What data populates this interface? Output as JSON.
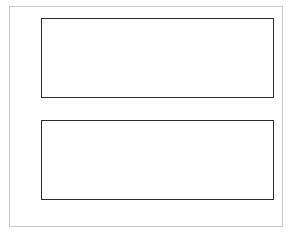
{
  "figure": {
    "background_color": "#ffffff",
    "frame_color": "#c9c9c9",
    "axis_color": "#2b2b2b",
    "line_color": "#2b2b2b",
    "xlabel_var": "x",
    "xlabel_rest": "-axis"
  },
  "chart_data": [
    {
      "type": "line",
      "panel": "top",
      "title": "",
      "xlabel": "",
      "ylabel": "",
      "xlim": [
        0,
        10
      ],
      "ylim": [
        -1.1,
        1.1
      ],
      "grid": false,
      "legend": null,
      "xticks": [
        0,
        2,
        4,
        6,
        8,
        10
      ],
      "xtick_labels": [
        "0",
        "2",
        "4",
        "6",
        "8",
        "10"
      ],
      "yticks": [
        -1.0,
        -0.5,
        0.0,
        0.5,
        1.0
      ],
      "ytick_labels": [
        "−1.0",
        "−0.5",
        "0.0",
        "0.5",
        "1.0"
      ],
      "series": [
        {
          "name": "sin(2.5x)",
          "color": "#2b2b2b",
          "linewidth": 1.0,
          "x": [
            0.0,
            0.1,
            0.2,
            0.3,
            0.4,
            0.5,
            0.6,
            0.7,
            0.8,
            0.9,
            1.0,
            1.1,
            1.2,
            1.3,
            1.4,
            1.5,
            1.6,
            1.7,
            1.8,
            1.9,
            2.0,
            2.1,
            2.2,
            2.3,
            2.4,
            2.5,
            2.6,
            2.7,
            2.8,
            2.9,
            3.0,
            3.1,
            3.2,
            3.3,
            3.4,
            3.5,
            3.6,
            3.7,
            3.8,
            3.9,
            4.0,
            4.1,
            4.2,
            4.3,
            4.4,
            4.5,
            4.6,
            4.7,
            4.8,
            4.9,
            5.0,
            5.1,
            5.2,
            5.3,
            5.4,
            5.5,
            5.6,
            5.7,
            5.8,
            5.9,
            6.0,
            6.1,
            6.2,
            6.3,
            6.4,
            6.5,
            6.6,
            6.7,
            6.8,
            6.9,
            7.0,
            7.1,
            7.2,
            7.3,
            7.4,
            7.5,
            7.6,
            7.7,
            7.8,
            7.9,
            8.0,
            8.1,
            8.2,
            8.3,
            8.4,
            8.5,
            8.6,
            8.7,
            8.8,
            8.9,
            9.0,
            9.1,
            9.2,
            9.3,
            9.4,
            9.5,
            9.6,
            9.7,
            9.8,
            9.9,
            10.0
          ],
          "y": [
            0.0,
            0.2474,
            0.4794,
            0.6816,
            0.8415,
            0.949,
            0.9975,
            0.984,
            0.9093,
            0.7781,
            0.5985,
            0.3818,
            0.1411,
            -0.1082,
            -0.3508,
            -0.5716,
            -0.7568,
            -0.8949,
            -0.9775,
            -0.9999,
            -0.9589,
            -0.8589,
            -0.7055,
            -0.5083,
            -0.2794,
            -0.0332,
            0.2151,
            0.4501,
            0.657,
            0.823,
            0.938,
            0.9946,
            0.9894,
            0.9228,
            0.7985,
            0.6242,
            0.4108,
            0.173,
            -0.0752,
            -0.3174,
            -0.544,
            -0.7373,
            -0.8847,
            -0.9757,
            -0.9991,
            -0.9668,
            -0.8752,
            -0.7259,
            -0.5332,
            -0.3072,
            -0.0663,
            0.1826,
            0.4206,
            0.6319,
            0.8038,
            0.9258,
            0.9901,
            0.993,
            0.9347,
            0.8183,
            0.6503,
            0.4394,
            0.204,
            -0.042,
            -0.2864,
            -0.5155,
            -0.7134,
            -0.8733,
            -0.9718,
            -0.9999,
            -0.958,
            -0.8673,
            -0.7175,
            -0.525,
            -0.2965,
            -0.0501,
            0.2005,
            0.4391,
            0.6489,
            0.8156,
            0.9327,
            0.9918,
            0.9886,
            0.9223,
            0.791,
            0.6185,
            0.3993,
            0.1602,
            -0.088,
            -0.3307,
            -0.5514,
            -0.7391,
            -0.883,
            -0.9751,
            -0.9991,
            -0.9663,
            -0.8702,
            -0.7205,
            -0.5217,
            -0.2848,
            -0.0752
          ]
        }
      ]
    },
    {
      "type": "line",
      "panel": "bottom",
      "title": "",
      "xlabel": "x-axis",
      "ylabel": "",
      "xlim": [
        0,
        10
      ],
      "ylim": [
        -2.2,
        2.2
      ],
      "grid": false,
      "legend": null,
      "xticks": [
        0,
        2,
        4,
        6,
        8,
        10
      ],
      "xtick_labels": [
        "0",
        "2",
        "4",
        "6",
        "8",
        "10"
      ],
      "yticks": [
        -2,
        -1,
        0,
        1,
        2
      ],
      "ytick_labels": [
        "−2",
        "−1",
        "0",
        "1",
        "2"
      ],
      "series": [
        {
          "name": "sin(x) + cos(2x)",
          "color": "#2b2b2b",
          "linewidth": 1.0,
          "x": [
            0.0,
            0.1,
            0.2,
            0.3,
            0.4,
            0.5,
            0.6,
            0.7,
            0.8,
            0.9,
            1.0,
            1.1,
            1.2,
            1.3,
            1.4,
            1.5,
            1.6,
            1.7,
            1.8,
            1.9,
            2.0,
            2.1,
            2.2,
            2.3,
            2.4,
            2.5,
            2.6,
            2.7,
            2.8,
            2.9,
            3.0,
            3.1,
            3.2,
            3.3,
            3.4,
            3.5,
            3.6,
            3.7,
            3.8,
            3.9,
            4.0,
            4.1,
            4.2,
            4.3,
            4.4,
            4.5,
            4.6,
            4.7,
            4.8,
            4.9,
            5.0,
            5.1,
            5.2,
            5.3,
            5.4,
            5.5,
            5.6,
            5.7,
            5.8,
            5.9,
            6.0,
            6.1,
            6.2,
            6.3,
            6.4,
            6.5,
            6.6,
            6.7,
            6.8,
            6.9,
            7.0,
            7.1,
            7.2,
            7.3,
            7.4,
            7.5,
            7.6,
            7.7,
            7.8,
            7.9,
            8.0,
            8.1,
            8.2,
            8.3,
            8.4,
            8.5,
            8.6,
            8.7,
            8.8,
            8.9,
            9.0,
            9.1,
            9.2,
            9.3,
            9.4,
            9.5,
            9.6,
            9.7,
            9.8,
            9.9,
            10.0
          ],
          "y": [
            1.0,
            1.0797,
            1.12,
            1.1208,
            1.0861,
            1.0204,
            0.9309,
            0.8251,
            0.7115,
            0.6,
            0.9975,
            0.4089,
            0.3706,
            0.3865,
            0.4593,
            0.5885,
            0.7682,
            0.9869,
            1.118,
            0.8266,
            0.2528,
            -0.4186,
            -1.0904,
            -1.6097,
            -1.89,
            -1.9002,
            -1.6588,
            -1.2186,
            -0.6582,
            -0.0715,
            0.4541,
            0.8473,
            1.0696,
            1.1215,
            1.0399,
            0.8844,
            0.7195,
            0.5931,
            0.529,
            0.5304,
            0.584,
            0.669,
            0.764,
            0.8494,
            0.9088,
            0.9272,
            0.8898,
            0.7817,
            0.5917,
            0.3189,
            -0.0242,
            -0.4111,
            -0.8056,
            -1.1674,
            -1.4567,
            -1.6406,
            -1.6996,
            -1.6308,
            -1.4485,
            -1.1813,
            -0.8674,
            -0.5485,
            -0.2632,
            -0.0406,
            0.104,
            0.1724,
            0.1804,
            0.153,
            0.1188,
            0.1043,
            0.1297,
            0.2049,
            0.3291,
            0.4901,
            0.6666,
            0.8318,
            0.9581,
            1.0226,
            1.0117,
            0.9245,
            0.7743,
            0.587,
            0.3968,
            0.2404,
            0.15,
            0.1476,
            0.2407,
            0.4202,
            0.661,
            0.9256,
            1.1008,
            1.085,
            0.8259,
            0.3353,
            -0.316,
            -1.0189,
            -1.6419,
            -2.0662,
            -2.2,
            -2.0041,
            -1.5122
          ]
        }
      ]
    }
  ]
}
